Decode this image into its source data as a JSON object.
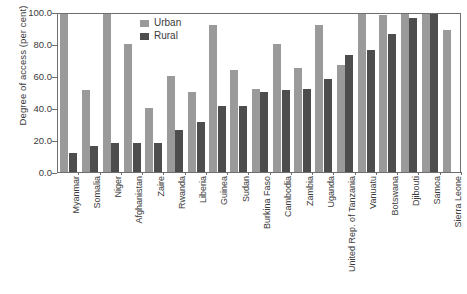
{
  "chart_data": {
    "type": "bar",
    "title": "",
    "subtitle": "",
    "xlabel": "",
    "ylabel": "Degree of access (per cent)",
    "ylim": [
      0.0,
      100.0
    ],
    "ytick_labels": [
      "100.0",
      "80.0",
      "60.0",
      "40.0",
      "20.0",
      "0.0"
    ],
    "ytick_values": [
      100.0,
      80.0,
      60.0,
      40.0,
      20.0,
      0.0
    ],
    "grid": false,
    "legend_position": "top-center",
    "categories": [
      "Myanmar",
      "Somalia",
      "Niger",
      "Afghanistan",
      "Zaire",
      "Rwanda",
      "Liberia",
      "Guinea",
      "Sudan",
      "Burkina Faso",
      "Cambodia",
      "Zambia",
      "Uganda",
      "United Rep. of Tanzania",
      "Vanuatu",
      "Botswana",
      "Djibouti",
      "Samoa",
      "Sierra Leone"
    ],
    "series": [
      {
        "name": "Urban",
        "color": "#9a9a9a",
        "values": [
          100.0,
          51.0,
          100.0,
          80.0,
          40.0,
          60.0,
          50.0,
          92.0,
          64.0,
          52.0,
          80.0,
          65.0,
          92.0,
          67.0,
          100.0,
          98.0,
          100.0,
          100.0,
          89.0
        ]
      },
      {
        "name": "Rural",
        "color": "#4d4d4d",
        "values": [
          12.0,
          16.0,
          18.0,
          18.0,
          18.0,
          26.0,
          31.0,
          41.0,
          41.0,
          50.0,
          51.0,
          52.0,
          58.0,
          73.0,
          76.0,
          86.0,
          96.0,
          100.0,
          null
        ]
      }
    ]
  },
  "legend": {
    "items": [
      {
        "label": "Urban",
        "swatch_class": "urban"
      },
      {
        "label": "Rural",
        "swatch_class": "rural"
      }
    ]
  },
  "axis": {
    "y_title": "Degree of access (per cent)"
  }
}
